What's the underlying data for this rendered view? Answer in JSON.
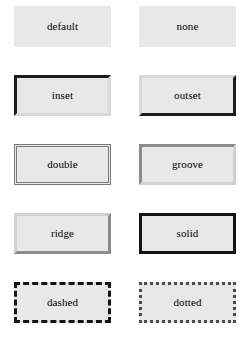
{
  "page": {
    "background_color": "#ffffff",
    "box_fill_color": "#e8e8e8",
    "text_color": "#000000"
  },
  "grid": {
    "columns": 2,
    "rows": 5,
    "boxes": [
      {
        "label": "default",
        "style_name": "default",
        "border_width": "0px",
        "border_color": "none",
        "fill": "#e8e8e8"
      },
      {
        "label": "none",
        "style_name": "none",
        "border_width": "0px",
        "border_color": "none",
        "fill": "#e8e8e8"
      },
      {
        "label": "inset",
        "style_name": "inset",
        "border_width": "3px",
        "border_color": "#1c1c1c #d9d9d9 #d9d9d9 #1c1c1c",
        "fill": "#e8e8e8"
      },
      {
        "label": "outset",
        "style_name": "outset",
        "border_width": "3px",
        "border_color": "#d9d9d9 #1c1c1c #1c1c1c #d9d9d9",
        "fill": "#e8e8e8"
      },
      {
        "label": "double",
        "style_name": "double",
        "border_width": "3px",
        "border_color": "#7a7a7a",
        "fill": "#e8e8e8"
      },
      {
        "label": "groove",
        "style_name": "groove",
        "border_width": "3px",
        "border_color": "#8c8c8c #d2d2d2 #d2d2d2 #8c8c8c",
        "fill": "#e8e8e8"
      },
      {
        "label": "ridge",
        "style_name": "ridge",
        "border_width": "3px",
        "border_color": "#d2d2d2 #8c8c8c #8c8c8c #d2d2d2",
        "fill": "#e8e8e8"
      },
      {
        "label": "solid",
        "style_name": "solid",
        "border_width": "3px",
        "border_color": "#141414",
        "fill": "#e8e8e8"
      },
      {
        "label": "dashed",
        "style_name": "dashed",
        "border_width": "3px",
        "border_color": "#141414",
        "fill": "#e8e8e8"
      },
      {
        "label": "dotted",
        "style_name": "dotted",
        "border_width": "3px",
        "border_color": "#4a4a4a",
        "fill": "#e8e8e8"
      }
    ]
  }
}
